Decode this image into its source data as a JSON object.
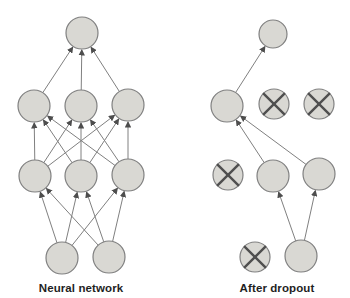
{
  "figure": {
    "width": 350,
    "height": 298,
    "background": "#ffffff"
  },
  "style": {
    "node_fill": "#d9d8d3",
    "node_stroke": "#808080",
    "edge_color": "#808080",
    "arrow_color": "#4d4d4d",
    "cross_color": "#4f4f4f",
    "label_color": "#1f1f1f"
  },
  "diagrams": [
    {
      "id": "neural-network",
      "label": "Neural network",
      "nodes": [
        {
          "id": "out",
          "x": 82,
          "y": 33,
          "r": 16,
          "dropped": false
        },
        {
          "id": "h1a",
          "x": 34,
          "y": 106,
          "r": 16,
          "dropped": false
        },
        {
          "id": "h1b",
          "x": 81,
          "y": 106,
          "r": 16,
          "dropped": false
        },
        {
          "id": "h1c",
          "x": 128,
          "y": 105,
          "r": 16,
          "dropped": false
        },
        {
          "id": "h2a",
          "x": 35,
          "y": 176,
          "r": 16,
          "dropped": false
        },
        {
          "id": "h2b",
          "x": 81,
          "y": 176,
          "r": 16,
          "dropped": false
        },
        {
          "id": "h2c",
          "x": 128,
          "y": 175,
          "r": 16,
          "dropped": false
        },
        {
          "id": "ina",
          "x": 62,
          "y": 258,
          "r": 16,
          "dropped": false
        },
        {
          "id": "inb",
          "x": 109,
          "y": 257,
          "r": 16,
          "dropped": false
        }
      ],
      "edges": [
        {
          "from": "h1a",
          "to": "out"
        },
        {
          "from": "h1b",
          "to": "out"
        },
        {
          "from": "h1c",
          "to": "out"
        },
        {
          "from": "h2a",
          "to": "h1a"
        },
        {
          "from": "h2a",
          "to": "h1b"
        },
        {
          "from": "h2a",
          "to": "h1c"
        },
        {
          "from": "h2b",
          "to": "h1a"
        },
        {
          "from": "h2b",
          "to": "h1b"
        },
        {
          "from": "h2b",
          "to": "h1c"
        },
        {
          "from": "h2c",
          "to": "h1a"
        },
        {
          "from": "h2c",
          "to": "h1b"
        },
        {
          "from": "h2c",
          "to": "h1c"
        },
        {
          "from": "ina",
          "to": "h2a"
        },
        {
          "from": "ina",
          "to": "h2b"
        },
        {
          "from": "ina",
          "to": "h2c"
        },
        {
          "from": "inb",
          "to": "h2a"
        },
        {
          "from": "inb",
          "to": "h2b"
        },
        {
          "from": "inb",
          "to": "h2c"
        }
      ]
    },
    {
      "id": "after-dropout",
      "label": "After dropout",
      "nodes": [
        {
          "id": "out",
          "x": 273,
          "y": 34,
          "r": 14,
          "dropped": false
        },
        {
          "id": "h1a",
          "x": 227,
          "y": 106,
          "r": 16,
          "dropped": false
        },
        {
          "id": "h1b",
          "x": 274,
          "y": 104,
          "r": 15,
          "dropped": true
        },
        {
          "id": "h1c",
          "x": 319,
          "y": 104,
          "r": 15,
          "dropped": true
        },
        {
          "id": "h2a",
          "x": 228,
          "y": 175,
          "r": 15,
          "dropped": true
        },
        {
          "id": "h2b",
          "x": 273,
          "y": 176,
          "r": 16,
          "dropped": false
        },
        {
          "id": "h2c",
          "x": 319,
          "y": 174,
          "r": 16,
          "dropped": false
        },
        {
          "id": "ina",
          "x": 255,
          "y": 257,
          "r": 15,
          "dropped": true
        },
        {
          "id": "inb",
          "x": 301,
          "y": 256,
          "r": 16,
          "dropped": false
        }
      ],
      "edges": [
        {
          "from": "h1a",
          "to": "out"
        },
        {
          "from": "h2b",
          "to": "h1a"
        },
        {
          "from": "h2c",
          "to": "h1a"
        },
        {
          "from": "inb",
          "to": "h2b"
        },
        {
          "from": "inb",
          "to": "h2c"
        }
      ]
    }
  ]
}
